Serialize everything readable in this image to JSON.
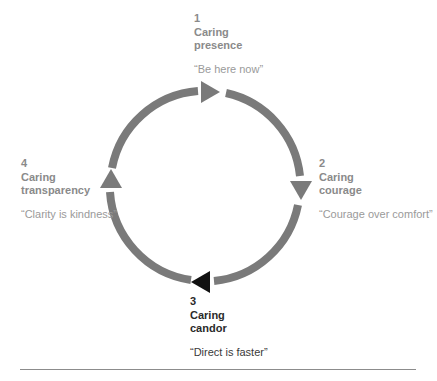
{
  "diagram": {
    "colors": {
      "ring": "#7a7a7a",
      "arrow_default": "#7a7a7a",
      "arrow_active": "#111111",
      "text_default": "#8a8a8a",
      "text_active": "#2a2a2a",
      "rule": "#8c8c8c"
    },
    "ring": {
      "center_x": 205,
      "center_y": 186,
      "radius": 95,
      "stroke_width": 8
    },
    "stages": [
      {
        "number": "1",
        "title": "Caring",
        "subtitle": "presence",
        "quote": "“Be here now”",
        "arrow_direction": "right",
        "active": false
      },
      {
        "number": "2",
        "title": "Caring",
        "subtitle": "courage",
        "quote": "“Courage over comfort”",
        "arrow_direction": "down",
        "active": false
      },
      {
        "number": "3",
        "title": "Caring",
        "subtitle": "candor",
        "quote": "“Direct is faster”",
        "arrow_direction": "left",
        "active": true
      },
      {
        "number": "4",
        "title": "Caring",
        "subtitle": "transparency",
        "quote": "“Clarity is kindness”",
        "arrow_direction": "up",
        "active": false
      }
    ]
  }
}
